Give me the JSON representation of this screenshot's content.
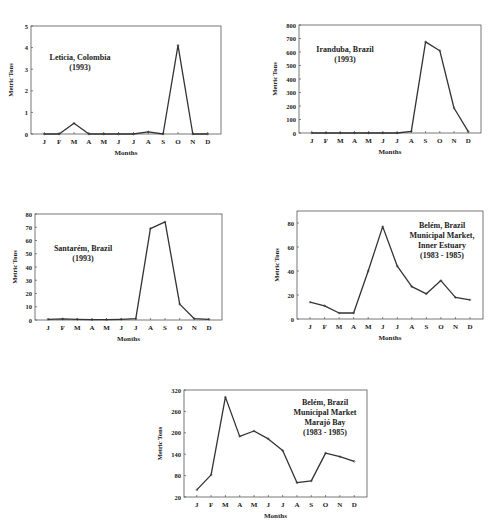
{
  "months": [
    "J",
    "F",
    "M",
    "A",
    "M",
    "J",
    "J",
    "A",
    "S",
    "O",
    "N",
    "D"
  ],
  "colors": {
    "line": "#333333",
    "frame": "#555555",
    "text": "#222222"
  },
  "chart_data": [
    {
      "type": "line",
      "title": [
        "Leticia, Colombia",
        "(1993)"
      ],
      "xlabel": "Months",
      "ylabel": "Metric Tons",
      "categories": [
        "J",
        "F",
        "M",
        "A",
        "M",
        "J",
        "J",
        "A",
        "S",
        "O",
        "N",
        "D"
      ],
      "values": [
        0,
        0,
        0.5,
        0,
        0,
        0,
        0,
        0.1,
        0,
        4.1,
        0,
        0
      ],
      "ylim": [
        0,
        5
      ],
      "yticks": [
        0,
        1,
        2,
        3,
        4,
        5
      ],
      "grid": false,
      "layout": {
        "x0": 31,
        "y0": 26,
        "x1": 221,
        "y1": 134,
        "title_x": 80,
        "title_y": 60,
        "title_anchor": "middle"
      }
    },
    {
      "type": "line",
      "title": [
        "Iranduba, Brazil",
        "(1993)"
      ],
      "xlabel": "Months",
      "ylabel": "Metric Tons",
      "categories": [
        "J",
        "F",
        "M",
        "A",
        "M",
        "J",
        "J",
        "A",
        "S",
        "O",
        "N",
        "D"
      ],
      "values": [
        0,
        0,
        0,
        0,
        0,
        0,
        0,
        12,
        675,
        610,
        185,
        10
      ],
      "ylim": [
        0,
        800
      ],
      "yticks": [
        0,
        100,
        200,
        300,
        400,
        500,
        600,
        700,
        800
      ],
      "grid": false,
      "layout": {
        "x0": 299,
        "y0": 25,
        "x1": 481,
        "y1": 133,
        "title_x": 345,
        "title_y": 52,
        "title_anchor": "middle"
      }
    },
    {
      "type": "line",
      "title": [
        "Santarém, Brazil",
        "(1993)"
      ],
      "xlabel": "Months",
      "ylabel": "Metric Tons",
      "categories": [
        "J",
        "F",
        "M",
        "A",
        "M",
        "J",
        "J",
        "A",
        "S",
        "O",
        "N",
        "D"
      ],
      "values": [
        0.5,
        0.8,
        0.5,
        0.3,
        0.3,
        0.5,
        1,
        69,
        74,
        12,
        1,
        0.5
      ],
      "ylim": [
        0,
        80
      ],
      "yticks": [
        0,
        10,
        20,
        30,
        40,
        50,
        60,
        70,
        80
      ],
      "grid": false,
      "layout": {
        "x0": 35,
        "y0": 214,
        "x1": 222,
        "y1": 320,
        "title_x": 83,
        "title_y": 251,
        "title_anchor": "middle"
      }
    },
    {
      "type": "line",
      "title": [
        "Belém, Brazil",
        "Municipal Market,",
        "Inner Estuary",
        "(1983 - 1985)"
      ],
      "xlabel": "Months",
      "ylabel": "Metric Tons",
      "categories": [
        "J",
        "F",
        "M",
        "A",
        "M",
        "J",
        "J",
        "A",
        "S",
        "O",
        "N",
        "D"
      ],
      "values": [
        14,
        11,
        5,
        5,
        40,
        77,
        44,
        27,
        21,
        32,
        18,
        16
      ],
      "ylim": [
        0,
        90
      ],
      "yticks": [
        0,
        20,
        40,
        60,
        80
      ],
      "grid": false,
      "layout": {
        "x0": 297,
        "y0": 211,
        "x1": 483,
        "y1": 319,
        "title_x": 442,
        "title_y": 228,
        "title_anchor": "middle"
      }
    },
    {
      "type": "line",
      "title": [
        "Belém, Brazil",
        "Municipal Market",
        "Marajó Bay",
        "(1983 - 1985)"
      ],
      "xlabel": "Months",
      "ylabel": "Metric Tons",
      "categories": [
        "J",
        "F",
        "M",
        "A",
        "M",
        "J",
        "J",
        "A",
        "S",
        "O",
        "N",
        "D"
      ],
      "values": [
        40,
        82,
        300,
        190,
        205,
        183,
        150,
        60,
        65,
        143,
        133,
        120
      ],
      "ylim": [
        20,
        320
      ],
      "yticks": [
        20,
        80,
        140,
        200,
        260,
        320
      ],
      "grid": false,
      "layout": {
        "x0": 184,
        "y0": 390,
        "x1": 367,
        "y1": 497,
        "title_x": 325,
        "title_y": 405,
        "title_anchor": "middle"
      }
    }
  ]
}
